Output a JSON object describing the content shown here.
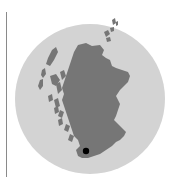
{
  "map": {
    "region": "Scotland",
    "type": "locator",
    "colors": {
      "background_circle": "#d3d3d3",
      "land": "#767676",
      "marker": "#000000",
      "rule": "#8a8a8a"
    },
    "marker": {
      "label": "",
      "x": 86,
      "y": 151
    }
  }
}
